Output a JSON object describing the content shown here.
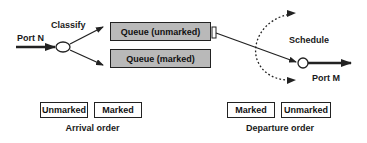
{
  "labels": {
    "input_port": "Port N",
    "classifier": "Classify",
    "scheduler": "Schedule",
    "output_port": "Port M"
  },
  "queues": [
    {
      "label": "Queue (unmarked)",
      "fill": "#b9b9b9"
    },
    {
      "label": "Queue (marked)",
      "fill": "#b9b9b9"
    }
  ],
  "arrival": {
    "caption": "Arrival order",
    "packets": [
      "Unmarked",
      "Marked"
    ]
  },
  "departure": {
    "caption": "Departure order",
    "packets": [
      "Marked",
      "Unmarked"
    ]
  },
  "colors": {
    "stroke": "#222222",
    "queue_fill": "#b9b9b9",
    "background": "#ffffff"
  }
}
